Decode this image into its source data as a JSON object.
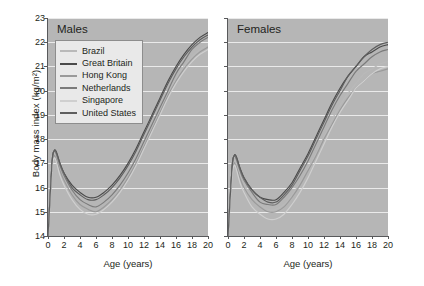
{
  "figure": {
    "yaxis_title": "Body mass index (kg/m²)",
    "xaxis_title": "Age (years)"
  },
  "panels": [
    {
      "id": "males",
      "title": "Males"
    },
    {
      "id": "females",
      "title": "Females"
    }
  ],
  "legend": {
    "entries": [
      {
        "label": "Brazil",
        "color": "#b9b9b9"
      },
      {
        "label": "Great Britain",
        "color": "#4a4a4a"
      },
      {
        "label": "Hong Kong",
        "color": "#9a9a9a"
      },
      {
        "label": "Netherlands",
        "color": "#7b7b7b"
      },
      {
        "label": "Singapore",
        "color": "#cfcfcf"
      },
      {
        "label": "United States",
        "color": "#5e5e5e"
      }
    ]
  },
  "axes": {
    "y_ticks": [
      14,
      15,
      16,
      17,
      18,
      19,
      20,
      21,
      22,
      23
    ],
    "x_ticks": [
      0,
      2,
      4,
      6,
      8,
      10,
      12,
      14,
      16,
      18,
      20
    ]
  },
  "chart_data": {
    "type": "line",
    "xlabel": "Age (years)",
    "ylabel": "Body mass index (kg/m²)",
    "xlim": [
      0,
      20
    ],
    "ylim": [
      14,
      23
    ],
    "grid": true,
    "legend_position": "inside-top-left-of-males-panel",
    "x": [
      0,
      0.5,
      0.75,
      1,
      1.5,
      2,
      3,
      4,
      5,
      6,
      7,
      8,
      9,
      10,
      11,
      12,
      13,
      14,
      15,
      16,
      17,
      18,
      19,
      20
    ],
    "panels": [
      {
        "name": "Males",
        "series": [
          {
            "name": "Brazil",
            "color": "#b9b9b9",
            "values": [
              14.0,
              16.9,
              17.4,
              17.3,
              16.8,
              16.4,
              15.9,
              15.5,
              15.3,
              15.2,
              15.4,
              15.7,
              16.1,
              16.6,
              17.2,
              17.8,
              18.5,
              19.2,
              19.9,
              20.5,
              21.0,
              21.4,
              21.7,
              21.9
            ]
          },
          {
            "name": "Great Britain",
            "color": "#4a4a4a",
            "values": [
              14.0,
              17.0,
              17.5,
              17.5,
              17.0,
              16.6,
              16.1,
              15.8,
              15.6,
              15.6,
              15.8,
              16.1,
              16.5,
              17.0,
              17.6,
              18.3,
              19.0,
              19.7,
              20.4,
              21.0,
              21.5,
              21.9,
              22.2,
              22.4
            ]
          },
          {
            "name": "Hong Kong",
            "color": "#9a9a9a",
            "values": [
              14.0,
              16.8,
              17.3,
              17.2,
              16.7,
              16.3,
              15.7,
              15.3,
              15.1,
              15.0,
              15.2,
              15.5,
              15.9,
              16.4,
              17.0,
              17.7,
              18.4,
              19.1,
              19.8,
              20.4,
              20.9,
              21.3,
              21.6,
              21.8
            ]
          },
          {
            "name": "Netherlands",
            "color": "#7b7b7b",
            "values": [
              14.0,
              17.0,
              17.5,
              17.4,
              16.9,
              16.5,
              15.9,
              15.5,
              15.3,
              15.2,
              15.4,
              15.7,
              16.1,
              16.6,
              17.2,
              17.9,
              18.6,
              19.3,
              20.0,
              20.7,
              21.2,
              21.7,
              22.0,
              22.2
            ]
          },
          {
            "name": "Singapore",
            "color": "#cfcfcf",
            "values": [
              14.0,
              16.7,
              17.2,
              17.1,
              16.5,
              16.1,
              15.5,
              15.1,
              14.9,
              14.9,
              15.1,
              15.4,
              15.8,
              16.3,
              16.9,
              17.6,
              18.3,
              19.0,
              19.7,
              20.3,
              20.8,
              21.2,
              21.5,
              21.7
            ]
          },
          {
            "name": "United States",
            "color": "#5e5e5e",
            "values": [
              14.0,
              17.0,
              17.5,
              17.5,
              17.0,
              16.6,
              16.0,
              15.7,
              15.5,
              15.5,
              15.7,
              16.0,
              16.4,
              16.9,
              17.5,
              18.2,
              18.9,
              19.6,
              20.3,
              20.9,
              21.4,
              21.8,
              22.1,
              22.3
            ]
          }
        ]
      },
      {
        "name": "Females",
        "series": [
          {
            "name": "Brazil",
            "color": "#b9b9b9",
            "values": [
              14.0,
              16.6,
              17.1,
              17.0,
              16.5,
              16.1,
              15.6,
              15.3,
              15.1,
              15.1,
              15.3,
              15.7,
              16.2,
              16.8,
              17.4,
              18.1,
              18.8,
              19.4,
              19.9,
              20.3,
              20.7,
              20.9,
              21.1,
              21.2
            ]
          },
          {
            "name": "Great Britain",
            "color": "#4a4a4a",
            "values": [
              14.0,
              16.8,
              17.3,
              17.3,
              16.8,
              16.4,
              15.9,
              15.6,
              15.5,
              15.5,
              15.8,
              16.2,
              16.8,
              17.4,
              18.1,
              18.8,
              19.5,
              20.1,
              20.6,
              21.0,
              21.4,
              21.6,
              21.8,
              21.9
            ]
          },
          {
            "name": "Hong Kong",
            "color": "#9a9a9a",
            "values": [
              14.0,
              16.5,
              17.0,
              16.9,
              16.4,
              16.0,
              15.5,
              15.2,
              15.0,
              15.0,
              15.2,
              15.6,
              16.1,
              16.7,
              17.3,
              18.0,
              18.6,
              19.2,
              19.7,
              20.1,
              20.4,
              20.7,
              20.8,
              20.9
            ]
          },
          {
            "name": "Netherlands",
            "color": "#7b7b7b",
            "values": [
              14.0,
              16.8,
              17.3,
              17.2,
              16.7,
              16.3,
              15.8,
              15.4,
              15.3,
              15.3,
              15.6,
              16.0,
              16.5,
              17.1,
              17.8,
              18.5,
              19.2,
              19.8,
              20.3,
              20.8,
              21.1,
              21.4,
              21.6,
              21.7
            ]
          },
          {
            "name": "Singapore",
            "color": "#cfcfcf",
            "values": [
              14.0,
              16.4,
              16.9,
              16.8,
              16.2,
              15.8,
              15.2,
              14.9,
              14.7,
              14.7,
              14.9,
              15.3,
              15.8,
              16.4,
              17.1,
              17.8,
              18.5,
              19.1,
              19.6,
              20.1,
              20.4,
              20.7,
              20.9,
              21.0
            ]
          },
          {
            "name": "United States",
            "color": "#5e5e5e",
            "values": [
              14.0,
              16.8,
              17.3,
              17.3,
              16.8,
              16.4,
              15.9,
              15.6,
              15.4,
              15.4,
              15.7,
              16.1,
              16.7,
              17.3,
              18.0,
              18.7,
              19.4,
              20.0,
              20.6,
              21.0,
              21.4,
              21.7,
              21.9,
              22.0
            ]
          }
        ]
      }
    ]
  }
}
